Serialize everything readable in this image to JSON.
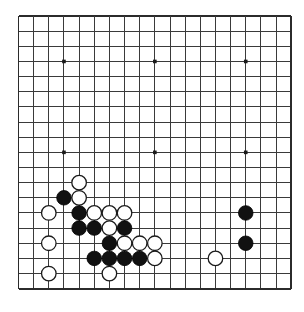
{
  "board": {
    "game": "Go",
    "size_label": "19x19",
    "size": 19,
    "origin_x": 18.5,
    "origin_y": 16.0,
    "spacing": 15.15,
    "colors": {
      "background": "#ffffff",
      "grid_line": "#3a3a3a",
      "edge_line": "#2b2b2b",
      "black_stone": "#111111",
      "white_stone": "#ffffff",
      "white_stone_border": "#1a1a1a",
      "star_point": "#1a1a1a"
    },
    "star_points": [
      [
        3,
        3
      ],
      [
        9,
        3
      ],
      [
        15,
        3
      ],
      [
        3,
        9
      ],
      [
        9,
        9
      ],
      [
        15,
        9
      ],
      [
        3,
        15
      ],
      [
        9,
        15
      ],
      [
        15,
        15
      ]
    ],
    "star_points_visible": [
      [
        3,
        3
      ],
      [
        9,
        3
      ],
      [
        15,
        3
      ],
      [
        3,
        9
      ],
      [
        9,
        9
      ],
      [
        15,
        9
      ]
    ],
    "stones": [
      {
        "color": "white",
        "col": 4,
        "row": 11
      },
      {
        "color": "black",
        "col": 3,
        "row": 12
      },
      {
        "color": "white",
        "col": 4,
        "row": 12
      },
      {
        "color": "white",
        "col": 2,
        "row": 13
      },
      {
        "color": "black",
        "col": 4,
        "row": 13
      },
      {
        "color": "white",
        "col": 5,
        "row": 13
      },
      {
        "color": "white",
        "col": 6,
        "row": 13
      },
      {
        "color": "white",
        "col": 7,
        "row": 13
      },
      {
        "color": "black",
        "col": 15,
        "row": 13
      },
      {
        "color": "black",
        "col": 4,
        "row": 14
      },
      {
        "color": "black",
        "col": 5,
        "row": 14
      },
      {
        "color": "white",
        "col": 6,
        "row": 14
      },
      {
        "color": "black",
        "col": 7,
        "row": 14
      },
      {
        "color": "white",
        "col": 2,
        "row": 15
      },
      {
        "color": "black",
        "col": 6,
        "row": 15
      },
      {
        "color": "white",
        "col": 7,
        "row": 15
      },
      {
        "color": "white",
        "col": 8,
        "row": 15
      },
      {
        "color": "white",
        "col": 9,
        "row": 15
      },
      {
        "color": "black",
        "col": 15,
        "row": 15
      },
      {
        "color": "black",
        "col": 5,
        "row": 16
      },
      {
        "color": "black",
        "col": 6,
        "row": 16
      },
      {
        "color": "black",
        "col": 7,
        "row": 16
      },
      {
        "color": "black",
        "col": 8,
        "row": 16
      },
      {
        "color": "white",
        "col": 9,
        "row": 16
      },
      {
        "color": "white",
        "col": 13,
        "row": 16
      },
      {
        "color": "white",
        "col": 2,
        "row": 17
      },
      {
        "color": "white",
        "col": 6,
        "row": 17
      }
    ],
    "counts": {
      "black_stones": 9,
      "white_stones": 18
    }
  }
}
